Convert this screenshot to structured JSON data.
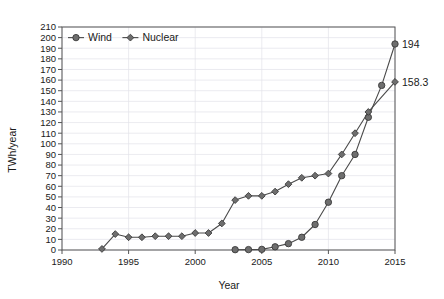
{
  "chart_data": {
    "type": "line",
    "title": "",
    "xlabel": "Year",
    "ylabel": "TWh/year",
    "xlim": [
      1990,
      2015
    ],
    "ylim": [
      0,
      210
    ],
    "ytick_step": 10,
    "xtick_step": 5,
    "grid": true,
    "legend_position": "top-left-inside",
    "x": [
      1990,
      1995,
      2000,
      2005,
      2010,
      2015
    ],
    "xticklabels": [
      "1990",
      "1995",
      "2000",
      "2005",
      "2010",
      "2015"
    ],
    "yticklabels": [
      "0",
      "10",
      "20",
      "30",
      "40",
      "50",
      "60",
      "70",
      "80",
      "90",
      "100",
      "110",
      "120",
      "130",
      "140",
      "150",
      "160",
      "170",
      "180",
      "190",
      "200",
      "210"
    ],
    "series": [
      {
        "name": "Wind",
        "marker": "circle",
        "color": "#6e6e6e",
        "line_color": "#4a4a4a",
        "points": [
          {
            "x": 2003,
            "y": 0.3
          },
          {
            "x": 2004,
            "y": 0.4
          },
          {
            "x": 2005,
            "y": 0.6
          },
          {
            "x": 2006,
            "y": 3
          },
          {
            "x": 2007,
            "y": 6
          },
          {
            "x": 2008,
            "y": 12
          },
          {
            "x": 2009,
            "y": 24
          },
          {
            "x": 2010,
            "y": 45
          },
          {
            "x": 2011,
            "y": 70
          },
          {
            "x": 2012,
            "y": 90
          },
          {
            "x": 2013,
            "y": 125
          },
          {
            "x": 2014,
            "y": 155
          },
          {
            "x": 2015,
            "y": 194
          }
        ],
        "end_label": "194"
      },
      {
        "name": "Nuclear",
        "marker": "diamond",
        "color": "#6e6e6e",
        "line_color": "#4a4a4a",
        "points": [
          {
            "x": 1993,
            "y": 1
          },
          {
            "x": 1994,
            "y": 15
          },
          {
            "x": 1995,
            "y": 12
          },
          {
            "x": 1996,
            "y": 12
          },
          {
            "x": 1997,
            "y": 13
          },
          {
            "x": 1998,
            "y": 13
          },
          {
            "x": 1999,
            "y": 13
          },
          {
            "x": 2000,
            "y": 16
          },
          {
            "x": 2001,
            "y": 16
          },
          {
            "x": 2002,
            "y": 25
          },
          {
            "x": 2003,
            "y": 47
          },
          {
            "x": 2004,
            "y": 51
          },
          {
            "x": 2005,
            "y": 51
          },
          {
            "x": 2006,
            "y": 55
          },
          {
            "x": 2007,
            "y": 62
          },
          {
            "x": 2008,
            "y": 68
          },
          {
            "x": 2009,
            "y": 70
          },
          {
            "x": 2010,
            "y": 72
          },
          {
            "x": 2011,
            "y": 90
          },
          {
            "x": 2012,
            "y": 110
          },
          {
            "x": 2013,
            "y": 130
          },
          {
            "x": 2015,
            "y": 158.3
          }
        ],
        "end_label": "158.3"
      }
    ],
    "legend": [
      {
        "label": "Wind",
        "marker": "circle"
      },
      {
        "label": "Nuclear",
        "marker": "diamond"
      }
    ],
    "colors": {
      "marker_fill": "#6e6e6e",
      "marker_stroke": "#3a3a3a",
      "line": "#4a4a4a",
      "grid": "#e3e3ea",
      "axis": "#555555",
      "background": "#ffffff"
    }
  }
}
